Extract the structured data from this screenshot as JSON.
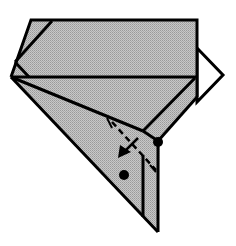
{
  "diagram": {
    "type": "origami-fold-step",
    "title": "",
    "colors": {
      "paper_colored": "#bcbcbc",
      "paper_white": "#ffffff",
      "line": "#000000",
      "background": "#ffffff"
    },
    "elements": {
      "shaded_paper": "colored side of folded paper",
      "white_flap": "white triangular flap at right",
      "valley_fold_line": "dashed fold line",
      "fold_arrow": "arrow indicating fold direction",
      "reference_dot_upper": "upper reference point",
      "reference_dot_lower": "lower reference point"
    },
    "labels": []
  }
}
